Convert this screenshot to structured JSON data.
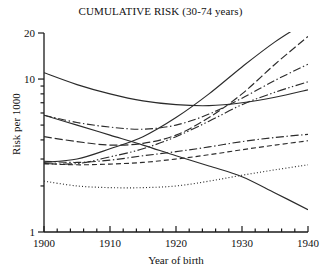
{
  "chart_data": {
    "type": "line",
    "title": "CUMULATIVE RISK (30-74 years)",
    "xlabel": "Year of birth",
    "ylabel": "Risk per 1000",
    "xlim": [
      1900,
      1940
    ],
    "ylim": [
      1,
      20
    ],
    "yscale": "log",
    "grid": false,
    "legend": "none",
    "x_ticks": [
      1900,
      1910,
      1920,
      1930,
      1940
    ],
    "x_tick_labels": [
      "1900",
      "1910",
      "1920",
      "1930",
      "1940"
    ],
    "x_minor_tick_step": 2,
    "y_ticks": [
      1,
      2,
      3,
      4,
      5,
      6,
      7,
      8,
      9,
      10,
      20
    ],
    "y_tick_labels": [
      "1",
      "10",
      "20"
    ],
    "y_labeled_ticks": [
      1,
      10,
      20
    ],
    "x": [
      1900,
      1905,
      1910,
      1915,
      1920,
      1925,
      1930,
      1935,
      1940
    ],
    "series": [
      {
        "name": "curve-steep-solid-rising",
        "style": "solid",
        "values": [
          2.85,
          3.0,
          3.5,
          4.2,
          5.6,
          8.0,
          12.0,
          17.5,
          24.0
        ]
      },
      {
        "name": "curve-longdash-rising",
        "style": "long-dash",
        "values": [
          4.2,
          3.9,
          3.7,
          3.8,
          4.3,
          5.6,
          8.0,
          12.5,
          19.0
        ]
      },
      {
        "name": "curve-dashdot-rising",
        "style": "dash-dot",
        "values": [
          5.8,
          5.2,
          4.85,
          4.7,
          5.0,
          5.9,
          7.5,
          9.8,
          12.5
        ]
      },
      {
        "name": "curve-dashdotdot-rising",
        "style": "dash-dot-dot",
        "values": [
          2.8,
          2.8,
          3.1,
          3.5,
          4.2,
          5.3,
          6.8,
          8.2,
          9.6
        ]
      },
      {
        "name": "curve-solid-ushaped",
        "style": "solid",
        "values": [
          11.0,
          9.2,
          8.0,
          7.2,
          6.8,
          6.7,
          7.0,
          7.6,
          8.5
        ]
      },
      {
        "name": "curve-dashdot-flat",
        "style": "dash-dot",
        "values": [
          2.9,
          2.85,
          2.95,
          3.15,
          3.35,
          3.6,
          3.9,
          4.15,
          4.35
        ]
      },
      {
        "name": "curve-dashed-flat",
        "style": "dashed",
        "values": [
          2.8,
          2.75,
          2.78,
          2.85,
          3.0,
          3.2,
          3.45,
          3.7,
          3.95
        ]
      },
      {
        "name": "curve-dotted-rising",
        "style": "dotted",
        "values": [
          2.15,
          2.0,
          1.95,
          1.95,
          2.0,
          2.15,
          2.35,
          2.55,
          2.75
        ]
      },
      {
        "name": "curve-solid-declining",
        "style": "solid",
        "values": [
          5.8,
          5.0,
          4.3,
          3.7,
          3.15,
          2.7,
          2.3,
          1.8,
          1.4
        ]
      }
    ],
    "annotations": []
  }
}
